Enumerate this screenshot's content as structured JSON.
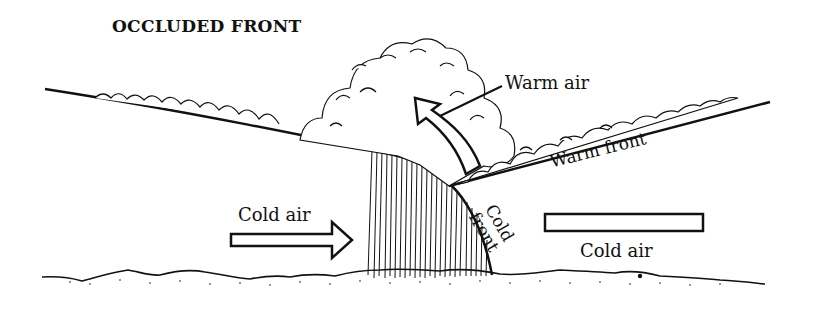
{
  "diagram": {
    "title": "OCCLUDED FRONT",
    "labels": {
      "warm_air": "Warm air",
      "warm_front": "Warm front",
      "cold_front_line1": "Cold",
      "cold_front_line2": "front",
      "cold_air_left": "Cold air",
      "cold_air_right": "Cold air"
    },
    "elements": [
      "cumulonimbus-cloud",
      "warm-air-rising-arrow",
      "cold-air-arrow-right",
      "cold-air-block",
      "precipitation-hatching",
      "ground-terrain"
    ],
    "colors": {
      "ink": "#111111",
      "background": "#ffffff"
    }
  }
}
